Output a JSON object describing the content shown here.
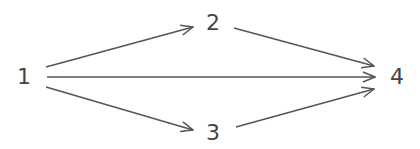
{
  "diagram": {
    "type": "directed-graph",
    "stroke_color": "#555555",
    "nodes": [
      {
        "id": "n1",
        "label": "1",
        "x": 24,
        "y": 77
      },
      {
        "id": "n2",
        "label": "2",
        "x": 213,
        "y": 23
      },
      {
        "id": "n3",
        "label": "3",
        "x": 213,
        "y": 133
      },
      {
        "id": "n4",
        "label": "4",
        "x": 397,
        "y": 77
      }
    ],
    "edges": [
      {
        "from": "1",
        "to": "2"
      },
      {
        "from": "1",
        "to": "4"
      },
      {
        "from": "1",
        "to": "3"
      },
      {
        "from": "2",
        "to": "4"
      },
      {
        "from": "3",
        "to": "4"
      }
    ]
  }
}
